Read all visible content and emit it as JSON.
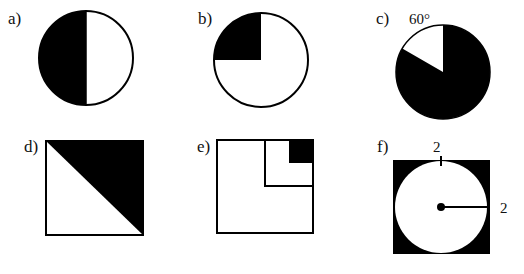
{
  "figures": [
    {
      "label": "a)",
      "shape": "circle",
      "shaded": "left half"
    },
    {
      "label": "b)",
      "shape": "circle",
      "shaded": "upper-left quarter"
    },
    {
      "label": "c)",
      "shape": "circle",
      "shaded": "all except 60° sector",
      "annotation": "60°"
    },
    {
      "label": "d)",
      "shape": "square",
      "shaded": "upper-right triangle"
    },
    {
      "label": "e)",
      "shape": "square",
      "shaded": "small top-right square (1/16)"
    },
    {
      "label": "f)",
      "shape": "square with inscribed circle",
      "shaded": "corners outside circle",
      "annotations": [
        "2",
        "2"
      ]
    }
  ],
  "colors": {
    "fill": "#000000",
    "background": "#ffffff",
    "stroke": "#000000"
  }
}
